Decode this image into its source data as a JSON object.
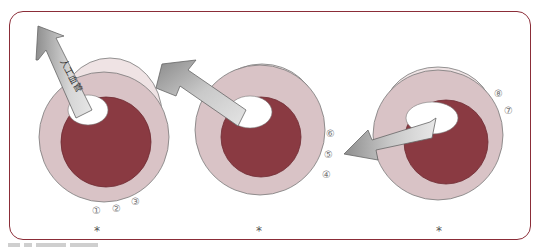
{
  "figure": {
    "frame_color": "#8b2d38",
    "colors": {
      "outer_ring": "#d9c3c6",
      "outer_back": "#efe3e4",
      "lumen": "#8a3a42",
      "hole": "#ffffff",
      "arrow_light": "#e2e2e2",
      "arrow_dark": "#8e8e8e"
    },
    "panels": [
      {
        "arrow_label": "人工血管",
        "markers": [
          "①",
          "②",
          "③"
        ],
        "asterisk": "*"
      },
      {
        "markers": [
          "④",
          "⑤",
          "⑥"
        ],
        "asterisk": "*"
      },
      {
        "markers": [
          "⑦",
          "⑧"
        ],
        "asterisk": "*"
      }
    ]
  }
}
